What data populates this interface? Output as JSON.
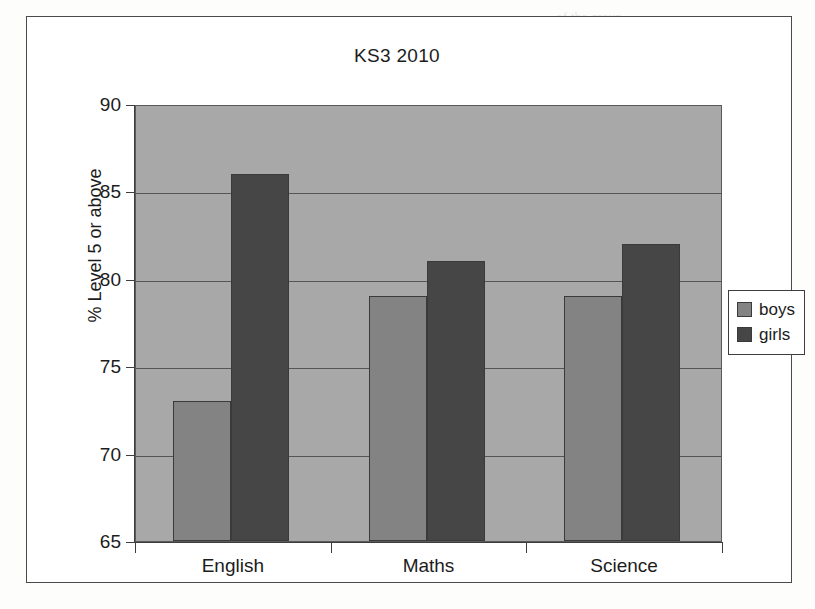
{
  "chart_data": {
    "type": "bar",
    "title": "KS3 2010",
    "xlabel": "",
    "ylabel": "% Level 5 or above",
    "categories": [
      "English",
      "Maths",
      "Science"
    ],
    "series": [
      {
        "name": "boys",
        "color": "#838383",
        "values": [
          73,
          79,
          79
        ]
      },
      {
        "name": "girls",
        "color": "#464646",
        "values": [
          86,
          81,
          82
        ]
      }
    ],
    "ylim": [
      65,
      90
    ],
    "ytick_step": 5,
    "yticks": [
      90,
      85,
      80,
      75,
      70,
      65
    ],
    "ytick_labels": [
      "90",
      "85",
      "80",
      "75",
      "70",
      "65"
    ],
    "grid": true,
    "grid_axis": "y",
    "legend": {
      "position": "right",
      "entries": [
        {
          "label": "boys",
          "color": "#838383"
        },
        {
          "label": "girls",
          "color": "#464646"
        }
      ]
    },
    "plot_background": "#a8a8a8",
    "figure_background": "#ffffff"
  },
  "figure": {
    "title": "KS3 2010",
    "y_axis_title": "% Level 5 or above"
  },
  "page_background": {
    "left_ghost": "",
    "right_ghost_lines": "of the group\nin the summer of 2010 the\nresults of the\nnational tests\nwere published. The\nschool had a\nvery strong set of\noutcomes across\nall three core\nsubjects.\n\nsection\nof the same\nyear group\ncontinued into\nthe sixth form"
  }
}
